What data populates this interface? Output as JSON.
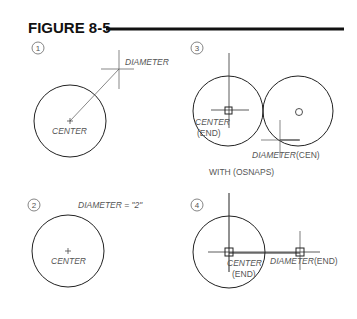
{
  "figure": {
    "title": "FIGURE 8-5",
    "panels": [
      {
        "number": "1",
        "center_label": "CENTER",
        "diameter_label": "DIAMETER"
      },
      {
        "number": "2",
        "center_label": "CENTER",
        "diameter_label": "DIAMETER  =  \"2\""
      },
      {
        "number": "3",
        "center_label": "CENTER",
        "center_snap": "(END)",
        "diameter_label": "DIAMETER",
        "diameter_snap": "(CEN)",
        "caption": "WITH  (OSNAPS)"
      },
      {
        "number": "4",
        "center_label": "CENTER",
        "center_snap": "(END)",
        "diameter_label": "DIAMETER",
        "diameter_snap": "(END)"
      }
    ]
  }
}
